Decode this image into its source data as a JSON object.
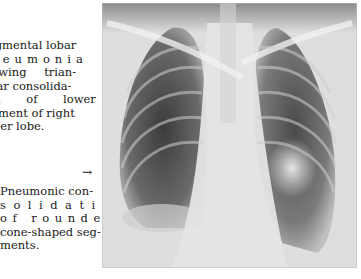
{
  "figure_1": {
    "caption_lines": [
      "Segmental lobar",
      "pneumonia",
      "showing trian-",
      "gular consolida-",
      "tion of lower",
      "segment of right",
      "upper lobe."
    ]
  },
  "figure_2": {
    "arrow": "→",
    "caption_lines": [
      "Pneumonic con-",
      "solidation",
      "of rounded,",
      "cone-shaped seg-",
      "ments."
    ]
  },
  "image": {
    "subject": "Chest radiograph (PA view)",
    "icon": "xray-image"
  }
}
